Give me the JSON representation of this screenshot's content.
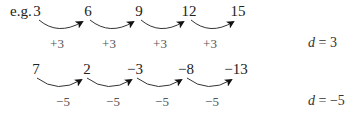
{
  "prefix": "e.g.",
  "rows": [
    {
      "terms": [
        "3",
        "6",
        "9",
        "12",
        "15"
      ],
      "differences": [
        "+3",
        "+3",
        "+3",
        "+3"
      ],
      "d_var": "d",
      "d_eq": " = 3"
    },
    {
      "terms": [
        "7",
        "2",
        "−3",
        "−8",
        "−13"
      ],
      "differences": [
        "−5",
        "−5",
        "−5",
        "−5"
      ],
      "d_var": "d",
      "d_eq": " = −5"
    }
  ]
}
